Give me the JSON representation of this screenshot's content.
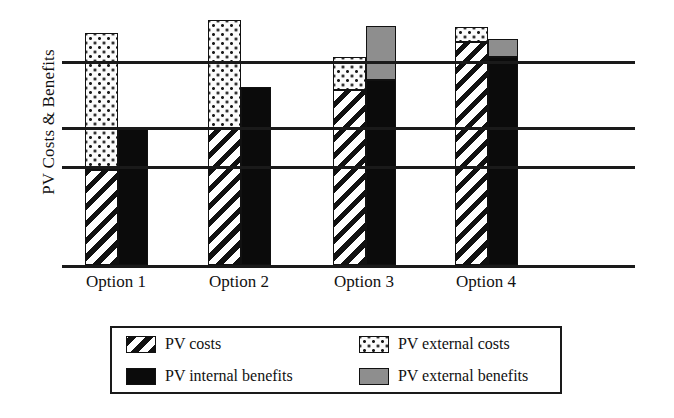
{
  "chart_data": {
    "type": "bar",
    "title": "",
    "subtitle": "",
    "xlabel": "",
    "ylabel": "PV Costs & Benefits",
    "categories": [
      "Option 1",
      "Option 2",
      "Option 3",
      "Option 4"
    ],
    "grid": true,
    "axis_tick_labels": [],
    "ylim": [
      0,
      100
    ],
    "legend_position": "bottom",
    "gridline_values": [
      49,
      68,
      100
    ],
    "series": [
      {
        "name": "PV costs",
        "key": "pv_costs",
        "pattern": "diagonal-hatch",
        "color": "#111111",
        "values": [
          46,
          68,
          86,
          108
        ]
      },
      {
        "name": "PV external costs",
        "key": "pv_external_costs",
        "pattern": "dotted",
        "color": "#fbfbfb",
        "values": [
          67,
          53,
          16,
          7
        ]
      },
      {
        "name": "PV internal benefits",
        "key": "pv_internal_benefits",
        "pattern": "solid",
        "color": "#0b0b0b",
        "values": [
          67,
          87,
          91,
          102
        ]
      },
      {
        "name": "PV external benefits",
        "key": "pv_external_benefits",
        "pattern": "solid-grey",
        "color": "#8e8e8e",
        "values": [
          0,
          0,
          26,
          9
        ]
      }
    ]
  },
  "chart": {
    "y_axis_label": "PV Costs & Benefits",
    "gridlines": [
      {
        "y": 61
      },
      {
        "y": 127
      },
      {
        "y": 166
      }
    ],
    "baseline_y": 265,
    "groups": [
      {
        "label": "Option 1",
        "label_left": 66,
        "label_width": 100,
        "cost_bar": {
          "left": 85,
          "width": 33
        },
        "benefit_bar": {
          "left": 118,
          "width": 30
        },
        "segments": {
          "pv_costs": {
            "top": 170,
            "bottom": 265
          },
          "pv_external_costs": {
            "top": 33,
            "bottom": 170
          },
          "pv_internal_benefits": {
            "top": 128,
            "bottom": 265
          },
          "pv_external_benefits": null
        }
      },
      {
        "label": "Option 2",
        "label_left": 189,
        "label_width": 100,
        "cost_bar": {
          "left": 208,
          "width": 33
        },
        "benefit_bar": {
          "left": 241,
          "width": 30
        },
        "segments": {
          "pv_costs": {
            "top": 128,
            "bottom": 265
          },
          "pv_external_costs": {
            "top": 20,
            "bottom": 128
          },
          "pv_internal_benefits": {
            "top": 87,
            "bottom": 265
          },
          "pv_external_benefits": null
        }
      },
      {
        "label": "Option 3",
        "label_left": 314,
        "label_width": 100,
        "cost_bar": {
          "left": 333,
          "width": 33
        },
        "benefit_bar": {
          "left": 366,
          "width": 30
        },
        "segments": {
          "pv_costs": {
            "top": 90,
            "bottom": 265
          },
          "pv_external_costs": {
            "top": 57,
            "bottom": 90
          },
          "pv_internal_benefits": {
            "top": 80,
            "bottom": 265
          },
          "pv_external_benefits": {
            "top": 26,
            "bottom": 80
          }
        }
      },
      {
        "label": "Option 4",
        "label_left": 436,
        "label_width": 100,
        "cost_bar": {
          "left": 455,
          "width": 33
        },
        "benefit_bar": {
          "left": 488,
          "width": 30
        },
        "segments": {
          "pv_costs": {
            "top": 42,
            "bottom": 265
          },
          "pv_external_costs": {
            "top": 27,
            "bottom": 42
          },
          "pv_internal_benefits": {
            "top": 57,
            "bottom": 265
          },
          "pv_external_benefits": {
            "top": 39,
            "bottom": 57
          }
        }
      }
    ]
  },
  "legend": {
    "entries": [
      {
        "label": "PV costs",
        "swatch": "pv_costs"
      },
      {
        "label": "PV external costs",
        "swatch": "pv_external_costs"
      },
      {
        "label": "PV internal benefits",
        "swatch": "pv_internal_benefits"
      },
      {
        "label": "PV external benefits",
        "swatch": "pv_external_benefits"
      }
    ]
  },
  "colors": {
    "ink": "#111111",
    "external_benefits_grey": "#8e8e8e",
    "internal_benefits_black": "#0b0b0b",
    "background": "#ffffff"
  }
}
